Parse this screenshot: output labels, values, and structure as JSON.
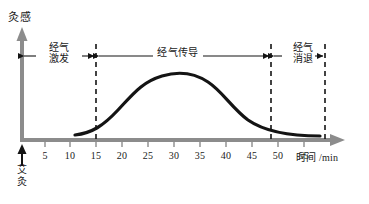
{
  "figure": {
    "name": "moxibustion-sensation-time-curve",
    "y_axis_title": "灸感",
    "x_axis_title": "时间 /min",
    "origin_label_lines": [
      "艾",
      "灸"
    ],
    "colors": {
      "axis": "#8c8c8c",
      "curve": "#141414",
      "dashed": "#141414",
      "text": "#1a1a1a",
      "background": "#ffffff"
    }
  },
  "phases": [
    {
      "id": "excitation",
      "lines": [
        "经气",
        "激发"
      ],
      "from_min": 0,
      "to_min": 15
    },
    {
      "id": "conduction",
      "lines": [
        "经气传导"
      ],
      "from_min": 15,
      "to_min": 48
    },
    {
      "id": "subsidence",
      "lines": [
        "经气",
        "消退"
      ],
      "from_min": 48,
      "to_min": 57
    }
  ],
  "ticks": [
    {
      "label": "5",
      "x": 45
    },
    {
      "label": "10",
      "x": 70
    },
    {
      "label": "15",
      "x": 96
    },
    {
      "label": "20",
      "x": 122
    },
    {
      "label": "25",
      "x": 148
    },
    {
      "label": "30",
      "x": 174
    },
    {
      "label": "35",
      "x": 200
    },
    {
      "label": "40",
      "x": 226
    },
    {
      "label": "45",
      "x": 252
    },
    {
      "label": "50",
      "x": 278
    },
    {
      "label": "55",
      "x": 304
    }
  ],
  "chart_data": {
    "type": "line",
    "title": "灸感",
    "xlabel": "时间 /min",
    "ylabel": "灸感",
    "xlim": [
      0,
      60
    ],
    "ylim": [
      0,
      1
    ],
    "grid": false,
    "legend": "none",
    "series": [
      {
        "name": "灸感强度",
        "x": [
          12,
          15,
          18,
          21,
          24,
          27,
          30,
          33,
          36,
          39,
          42,
          45,
          48,
          51,
          54,
          57
        ],
        "values": [
          0.03,
          0.05,
          0.11,
          0.21,
          0.36,
          0.53,
          0.69,
          0.8,
          0.84,
          0.82,
          0.73,
          0.58,
          0.41,
          0.27,
          0.15,
          0.06
        ]
      }
    ],
    "annotations": [
      {
        "text": "经气激发",
        "x_range": [
          0,
          15
        ]
      },
      {
        "text": "经气传导",
        "x_range": [
          15,
          48
        ]
      },
      {
        "text": "经气消退",
        "x_range": [
          48,
          57
        ]
      },
      {
        "text": "艾灸",
        "x": 0
      }
    ],
    "dashed_verticals": [
      15,
      48,
      57
    ]
  }
}
